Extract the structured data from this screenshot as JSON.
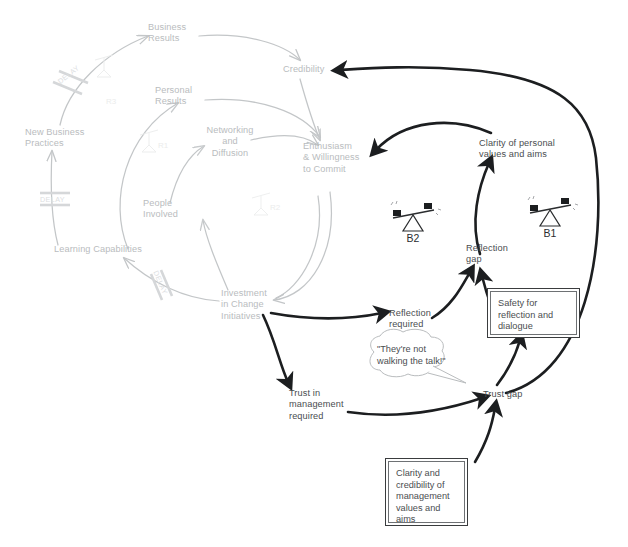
{
  "diagram": {
    "colors": {
      "faint_gray": "#c3c6c8",
      "dark_ink": "#1c1e20",
      "text_gray": "#8e9194",
      "text_dark": "#4a4d50",
      "watermark": "#ebecec"
    },
    "background_nodes": [
      {
        "id": "business-results",
        "label": "Business\nResults"
      },
      {
        "id": "personal-results",
        "label": "Personal\nResults"
      },
      {
        "id": "networking-diffusion",
        "label": "Networking\nand\nDiffusion"
      },
      {
        "id": "new-business-practices",
        "label": "New Business\nPractices"
      },
      {
        "id": "people-involved",
        "label": "People\nInvolved"
      },
      {
        "id": "learning-capabilities",
        "label": "Learning Capabilities"
      },
      {
        "id": "investment-change",
        "label": "Investment\nin Change\nInitiatives"
      },
      {
        "id": "credibility",
        "label": "Credibility"
      },
      {
        "id": "enthusiasm-commit",
        "label": "Enthusiasm\n& Willingness\nto Commit"
      }
    ],
    "foreground_nodes": [
      {
        "id": "clarity-personal-values",
        "label": "Clarity of personal\nvalues and aims"
      },
      {
        "id": "reflection-gap",
        "label": "Reflection\ngap"
      },
      {
        "id": "reflection-required",
        "label": "Reflection\nrequired"
      },
      {
        "id": "trust-management-required",
        "label": "Trust in\nmanagement\nrequired"
      },
      {
        "id": "trust-gap",
        "label": "Trust gap"
      }
    ],
    "boxed_notes": [
      {
        "id": "safety-note",
        "label": "Safety for\nreflection and\ndialogue"
      },
      {
        "id": "clarity-credibility-note",
        "label": "Clarity and\ncredibility of\nmanagement\nvalues and\naims"
      }
    ],
    "speech_bubble": {
      "id": "walking-the-talk",
      "label": "\"They're not\nwalking the talk!\""
    },
    "loop_markers": [
      {
        "id": "B2",
        "label": "B2"
      },
      {
        "id": "B1",
        "label": "B1"
      }
    ],
    "watermark_loop_tags": [
      {
        "id": "R3",
        "label": "R3"
      },
      {
        "id": "R1",
        "label": "R1"
      },
      {
        "id": "R2",
        "label": "R2"
      }
    ],
    "delay_markers": [
      {
        "id": "delay-top",
        "label": "DELAY"
      },
      {
        "id": "delay-mid",
        "label": "DELAY"
      },
      {
        "id": "delay-bottom",
        "label": "DELAY"
      }
    ]
  }
}
